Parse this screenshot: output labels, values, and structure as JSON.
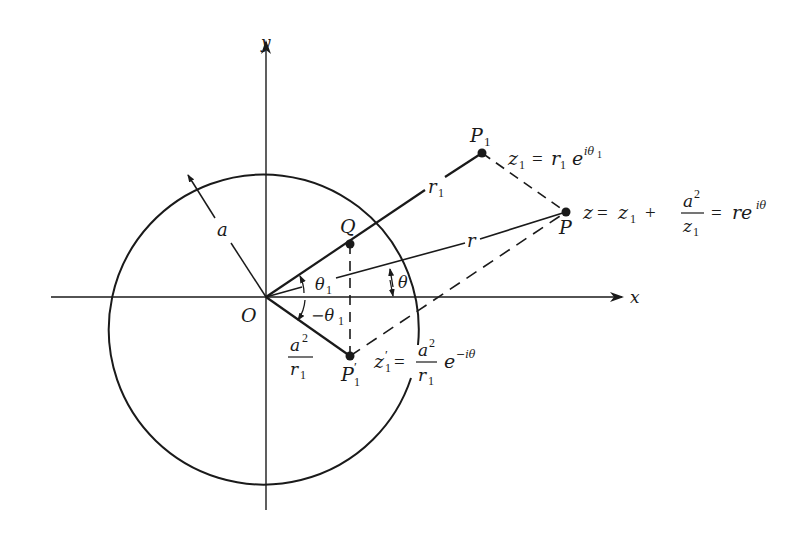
{
  "diagram": {
    "type": "complex-plane geometric construction",
    "axes": {
      "x_label": "x",
      "y_label": "y",
      "origin_label": "O"
    },
    "circle": {
      "radius_label": "a"
    },
    "points": {
      "P1": {
        "label": "P",
        "subscript": "1"
      },
      "P": {
        "label": "P"
      },
      "Q": {
        "label": "Q"
      },
      "P1_prime": {
        "label": "P",
        "prime": "′",
        "subscript": "1"
      }
    },
    "segments": {
      "r1_label": "r",
      "r1_sub": "1",
      "r_label": "r"
    },
    "angles": {
      "theta1": {
        "sym": "θ",
        "sub": "1"
      },
      "neg_theta1": {
        "sym": "−θ",
        "sub": "1"
      },
      "theta": {
        "sym": "θ"
      }
    },
    "fraction_a2_r1": {
      "num": "a",
      "num_sup": "2",
      "den": "r",
      "den_sub": "1"
    },
    "equations": {
      "z1": {
        "lhs": "z",
        "lhs_sub": "1",
        "eq": "=",
        "r": "r",
        "r_sub": "1",
        "e": "e",
        "exp": "iθ",
        "exp_sub": "1"
      },
      "z": {
        "lhs": "z",
        "eq": "=",
        "z1": "z",
        "z1_sub": "1",
        "plus": "+",
        "frac_num": "a",
        "frac_num_sup": "2",
        "frac_den": "z",
        "frac_den_sub": "1",
        "eq2": "=",
        "rhs": "re",
        "rhs_exp": "iθ"
      },
      "z1_prime": {
        "lhs": "z",
        "prime": "′",
        "lhs_sub": "1",
        "eq": "=",
        "frac_num": "a",
        "frac_num_sup": "2",
        "frac_den": "r",
        "frac_den_sub": "1",
        "e": "e",
        "exp": "−iθ"
      }
    }
  }
}
